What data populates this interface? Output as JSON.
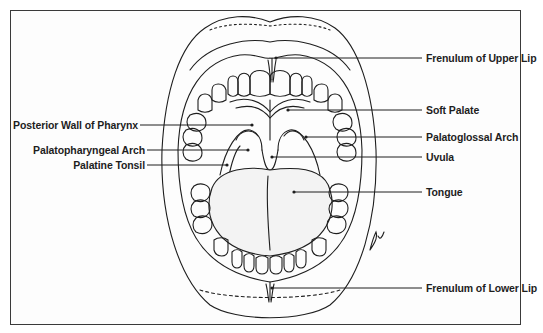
{
  "diagram": {
    "labels_left": [
      {
        "id": "posterior-wall-of-pharynx",
        "text": "Posterior Wall of Pharynx"
      },
      {
        "id": "palatopharyngeal-arch",
        "text": "Palatopharyngeal Arch"
      },
      {
        "id": "palatine-tonsil",
        "text": "Palatine Tonsil"
      }
    ],
    "labels_right": [
      {
        "id": "frenulum-of-upper-lip",
        "text": "Frenulum of Upper Lip"
      },
      {
        "id": "soft-palate",
        "text": "Soft Palate"
      },
      {
        "id": "palatoglossal-arch",
        "text": "Palatoglossal Arch"
      },
      {
        "id": "uvula",
        "text": "Uvula"
      },
      {
        "id": "tongue",
        "text": "Tongue"
      },
      {
        "id": "frenulum-of-lower-lip",
        "text": "Frenulum of Lower Lip"
      }
    ],
    "signature": "jpf",
    "colors": {
      "line": "#1e1e1e",
      "border": "#3a3a3a",
      "background": "#ffffff"
    }
  }
}
